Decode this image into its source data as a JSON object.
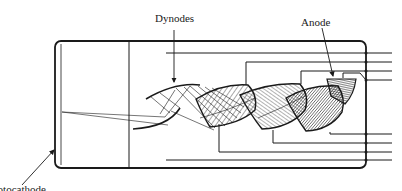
{
  "diagram": {
    "labels": {
      "dynodes": "Dynodes",
      "anode": "Anode",
      "photocathode": "Photocathode"
    },
    "colors": {
      "line": "#1a1a1a",
      "background": "#ffffff",
      "hatch": "#222222"
    },
    "components": [
      {
        "id": "envelope",
        "kind": "rounded-rectangle"
      },
      {
        "id": "photocathode",
        "kind": "window"
      },
      {
        "id": "focusing-electrode",
        "kind": "vertical-line"
      },
      {
        "id": "dynode-1",
        "kind": "curved-electrode"
      },
      {
        "id": "dynode-2",
        "kind": "curved-electrode"
      },
      {
        "id": "dynode-3",
        "kind": "curved-electrode"
      },
      {
        "id": "dynode-4",
        "kind": "curved-electrode"
      },
      {
        "id": "anode",
        "kind": "collector"
      }
    ],
    "lead_count_top": 4,
    "lead_count_bottom": 4
  }
}
